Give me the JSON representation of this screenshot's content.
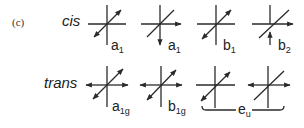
{
  "panel": {
    "label": "(c)"
  },
  "rows": [
    {
      "label": "cis",
      "modes": [
        {
          "symbol": "a",
          "subscript": "1",
          "center": [
            107,
            24
          ]
        },
        {
          "symbol": "a",
          "subscript": "1",
          "center": [
            160,
            24
          ]
        },
        {
          "symbol": "b",
          "subscript": "1",
          "center": [
            216,
            24
          ]
        },
        {
          "symbol": "b",
          "subscript": "2",
          "center": [
            272,
            24
          ]
        }
      ]
    },
    {
      "label": "trans",
      "modes": [
        {
          "symbol": "a",
          "subscript": "1g",
          "center": [
            107,
            85
          ]
        },
        {
          "symbol": "b",
          "subscript": "1g",
          "center": [
            161,
            85
          ]
        },
        {
          "symbol": "e",
          "subscript": "u",
          "center": [
            215,
            85
          ],
          "group": "eu"
        },
        {
          "symbol": "e",
          "subscript": "u",
          "center": [
            268,
            85
          ],
          "group": "eu"
        }
      ],
      "bracket": {
        "symbol": "e",
        "subscript": "u"
      }
    }
  ],
  "labels": {
    "cis_a1_first": "a",
    "cis_a1_first_sub": "1",
    "cis_a1_second": "a",
    "cis_a1_second_sub": "1",
    "cis_b1": "b",
    "cis_b1_sub": "1",
    "cis_b2": "b",
    "cis_b2_sub": "2",
    "trans_a1g": "a",
    "trans_a1g_sub": "1g",
    "trans_b1g": "b",
    "trans_b1g_sub": "1g",
    "trans_eu": "e",
    "trans_eu_sub": "u"
  },
  "colors": {
    "ink": "#2a2a2a",
    "background": "#ffffff"
  }
}
